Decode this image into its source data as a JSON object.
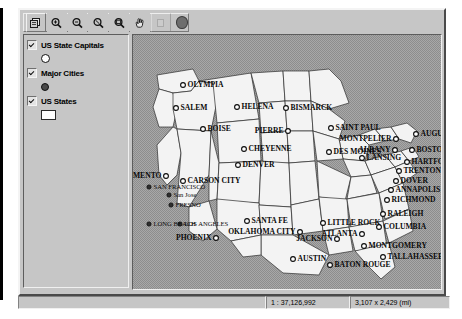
{
  "app": {
    "title": "GIS Map Window"
  },
  "toolbar": {
    "buttons": [
      {
        "name": "layer-control-icon",
        "label": "Layer Control"
      },
      {
        "name": "zoom-in-icon",
        "label": "Zoom In"
      },
      {
        "name": "zoom-out-icon",
        "label": "Zoom Out"
      },
      {
        "name": "zoom-previous-icon",
        "label": "Zoom Previous"
      },
      {
        "name": "zoom-entire-layer-icon",
        "label": "Zoom Entire Layer"
      },
      {
        "name": "pan-hand-icon",
        "label": "Pan"
      },
      {
        "name": "disabled-tool-icon",
        "label": ""
      }
    ],
    "indicator": "record-indicator"
  },
  "layers": [
    {
      "name": "US State Capitals",
      "checked": true,
      "symbol": "open-circle"
    },
    {
      "name": "Major Cities",
      "checked": true,
      "symbol": "filled-dot"
    },
    {
      "name": "US States",
      "checked": true,
      "symbol": "white-polygon"
    }
  ],
  "status": {
    "message": "",
    "scale": "1 : 37,126,992",
    "extent": "3,107 x 2,429 (mi)"
  },
  "map": {
    "capitals": [
      {
        "name": "OLYMPIA",
        "x": 50,
        "y": 50,
        "anchor": "right"
      },
      {
        "name": "SALEM",
        "x": 43,
        "y": 73,
        "anchor": "right"
      },
      {
        "name": "HELENA",
        "x": 104,
        "y": 72,
        "anchor": "right"
      },
      {
        "name": "BOISE",
        "x": 70,
        "y": 94,
        "anchor": "right"
      },
      {
        "name": "BISMARCK",
        "x": 153,
        "y": 73,
        "anchor": "right"
      },
      {
        "name": "PIERRE",
        "x": 155,
        "y": 96,
        "anchor": "left"
      },
      {
        "name": "SAINT PAUL",
        "x": 198,
        "y": 93,
        "anchor": "right"
      },
      {
        "name": "CHEYENNE",
        "x": 111,
        "y": 114,
        "anchor": "right"
      },
      {
        "name": "DENVER",
        "x": 105,
        "y": 130,
        "anchor": "right"
      },
      {
        "name": "DES MOINES",
        "x": 196,
        "y": 117,
        "anchor": "right"
      },
      {
        "name": "MONTPELIER",
        "x": 263,
        "y": 104,
        "anchor": "left"
      },
      {
        "name": "AUGUSTA",
        "x": 283,
        "y": 99,
        "anchor": "right"
      },
      {
        "name": "ALBANY",
        "x": 262,
        "y": 115,
        "anchor": "left"
      },
      {
        "name": "BOSTON",
        "x": 279,
        "y": 115,
        "anchor": "right"
      },
      {
        "name": "LANSING",
        "x": 229,
        "y": 123,
        "anchor": "right"
      },
      {
        "name": "HARTFORD",
        "x": 274,
        "y": 127,
        "anchor": "right"
      },
      {
        "name": "TRENTON",
        "x": 266,
        "y": 136,
        "anchor": "right"
      },
      {
        "name": "DOVER",
        "x": 263,
        "y": 146,
        "anchor": "right"
      },
      {
        "name": "ANNAPOLIS",
        "x": 258,
        "y": 155,
        "anchor": "right"
      },
      {
        "name": "RICHMOND",
        "x": 254,
        "y": 165,
        "anchor": "right"
      },
      {
        "name": "RALEIGH",
        "x": 250,
        "y": 179,
        "anchor": "right"
      },
      {
        "name": "CARSON CITY",
        "x": 50,
        "y": 146,
        "anchor": "right"
      },
      {
        "name": "SANTA FE",
        "x": 114,
        "y": 186,
        "anchor": "right"
      },
      {
        "name": "OKLAHOMA CITY",
        "x": 167,
        "y": 197,
        "anchor": "left"
      },
      {
        "name": "LITTLE ROCK",
        "x": 190,
        "y": 188,
        "anchor": "right"
      },
      {
        "name": "COLUMBIA",
        "x": 246,
        "y": 192,
        "anchor": "right"
      },
      {
        "name": "ATLANTA",
        "x": 229,
        "y": 199,
        "anchor": "left"
      },
      {
        "name": "JACKSON",
        "x": 204,
        "y": 204,
        "anchor": "left"
      },
      {
        "name": "MONTGOMERY",
        "x": 231,
        "y": 211,
        "anchor": "right"
      },
      {
        "name": "TALLAHASSEE",
        "x": 250,
        "y": 222,
        "anchor": "right"
      },
      {
        "name": "AUSTIN",
        "x": 160,
        "y": 224,
        "anchor": "right"
      },
      {
        "name": "BATON ROUGE",
        "x": 197,
        "y": 230,
        "anchor": "right"
      },
      {
        "name": "PHOENIX",
        "x": 83,
        "y": 203,
        "anchor": "left"
      },
      {
        "name": "SACRAMENTO",
        "x": 33,
        "y": 141,
        "anchor": "left"
      }
    ],
    "cities": [
      {
        "name": "San Jose",
        "x": 36,
        "y": 160,
        "anchor": "right"
      },
      {
        "name": "FRESNO",
        "x": 38,
        "y": 170,
        "anchor": "right"
      },
      {
        "name": "LOS ANGELES",
        "x": 47,
        "y": 189,
        "anchor": "right"
      },
      {
        "name": "SAN FRANCISCO",
        "x": 16,
        "y": 152,
        "anchor": "right"
      },
      {
        "name": "LONG BEACH",
        "x": 16,
        "y": 189,
        "anchor": "right"
      }
    ]
  }
}
